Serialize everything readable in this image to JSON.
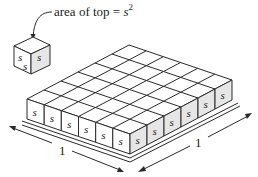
{
  "diagram": {
    "callout": {
      "prefix": "area of top = ",
      "variable": "s",
      "exponent": "2"
    },
    "small_cube": {
      "edge_label": "s",
      "face_labels": [
        "s",
        "s",
        "s"
      ]
    },
    "slab": {
      "grid_rows": 6,
      "grid_cols": 6,
      "cube_label": "s"
    },
    "dimensions": {
      "left_edge_label": "1",
      "right_edge_label": "1"
    },
    "colors": {
      "line": "#2a2a2a",
      "face_light": "#ffffff",
      "face_shaded": "#e6e6e6",
      "background": "#ffffff"
    }
  }
}
